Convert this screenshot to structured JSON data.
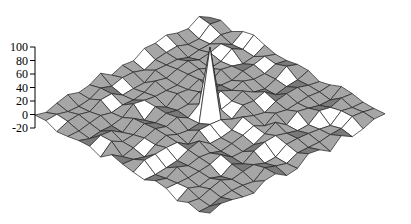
{
  "chart_data": {
    "type": "surface",
    "title": "",
    "xlabel": "",
    "ylabel": "",
    "zlabel": "",
    "z_ticks": [
      100,
      80,
      60,
      40,
      20,
      0,
      -20
    ],
    "zlim": [
      -20,
      100
    ],
    "grid_size": 17,
    "grid_on": true,
    "legend": null,
    "peak": {
      "row": 8,
      "col": 8,
      "z": 100
    },
    "surface_color": "#a6a6a6",
    "shadow_color": "#7a7a7a",
    "highlight_color": "#ffffff",
    "edge_color": "#222222"
  },
  "axis": {
    "labels": [
      "100",
      "80",
      "60",
      "40",
      "20",
      "0",
      "-20"
    ]
  }
}
